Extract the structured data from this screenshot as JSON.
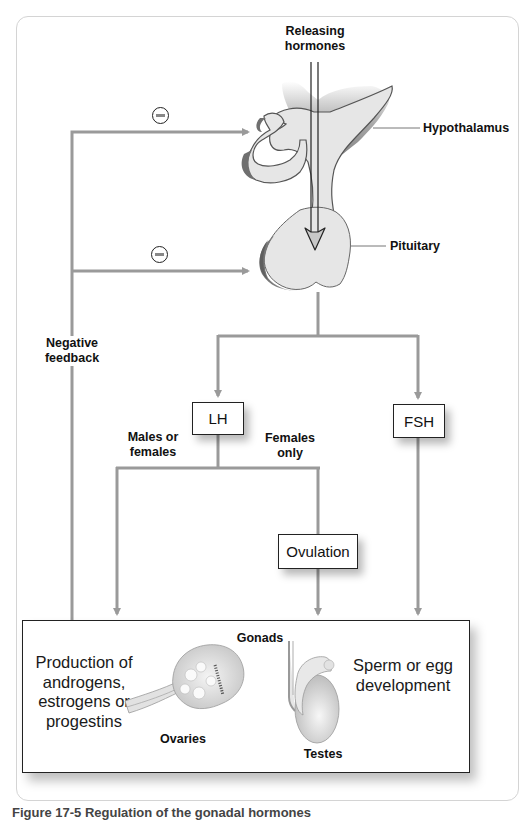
{
  "diagram": {
    "type": "hormone-regulation-flowchart",
    "colors": {
      "line": "#9a9a9a",
      "gland_fill": "#e6e6e6",
      "gland_shadow": "#7d7d7d",
      "box_border": "#222222"
    },
    "labels": {
      "releasing_hormones_line1": "Releasing",
      "releasing_hormones_line2": "hormones",
      "hypothalamus": "Hypothalamus",
      "pituitary": "Pituitary",
      "negative_feedback_line1": "Negative",
      "negative_feedback_line2": "feedback",
      "males_or_females_line1": "Males or",
      "males_or_females_line2": "females",
      "females_only_line1": "Females",
      "females_only_line2": "only"
    },
    "inhibition_markers": [
      {
        "symbol": "minus",
        "target": "hypothalamus"
      },
      {
        "symbol": "minus",
        "target": "pituitary"
      }
    ],
    "boxes": {
      "lh": "LH",
      "fsh": "FSH",
      "ovulation": "Ovulation"
    },
    "gonads": {
      "title": "Gonads",
      "left_text": [
        "Production of",
        "androgens,",
        "estrogens or",
        "progestins"
      ],
      "right_text": [
        "Sperm or egg",
        "development"
      ],
      "ovaries_label": "Ovaries",
      "testes_label": "Testes"
    },
    "edges": [
      {
        "from": "Releasing hormones",
        "to": "Pituitary"
      },
      {
        "from": "Pituitary",
        "to": "LH"
      },
      {
        "from": "Pituitary",
        "to": "FSH"
      },
      {
        "from": "LH",
        "to": "Gonads",
        "label": "Males or females"
      },
      {
        "from": "LH",
        "to": "Ovulation",
        "label": "Females only"
      },
      {
        "from": "Ovulation",
        "to": "Gonads"
      },
      {
        "from": "FSH",
        "to": "Gonads"
      },
      {
        "from": "Gonads",
        "to": "Hypothalamus",
        "label": "Negative feedback",
        "effect": "inhibit"
      },
      {
        "from": "Gonads",
        "to": "Pituitary",
        "label": "Negative feedback",
        "effect": "inhibit"
      }
    ]
  },
  "caption": "Figure 17-5 Regulation of the gonadal hormones"
}
